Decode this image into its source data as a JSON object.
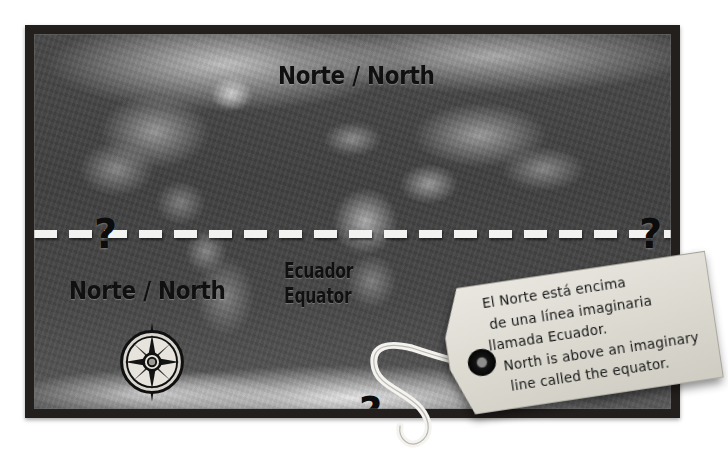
{
  "poster": {
    "frame_color": "#231f1d",
    "map_name": "world-relief-map-grayscale"
  },
  "map": {
    "labels": {
      "north_top": "Norte / North",
      "north_left": "Norte / North",
      "equator_line1": "Ecuador",
      "equator_line2": "Equator"
    },
    "question_marks": {
      "left": "?",
      "right": "?",
      "bottom": "?"
    },
    "equator": {
      "style": "dashed",
      "color": "#f2f2f0"
    },
    "compass": {
      "name": "compass-rose",
      "points": 8
    }
  },
  "tag": {
    "lines": [
      "El Norte está encima",
      "de una línea imaginaria",
      "llamada Ecuador.",
      "North is above an imaginary",
      "line called the equator."
    ],
    "paper_color": "#e4e2da",
    "grommet_color": "#0b0b0b"
  }
}
